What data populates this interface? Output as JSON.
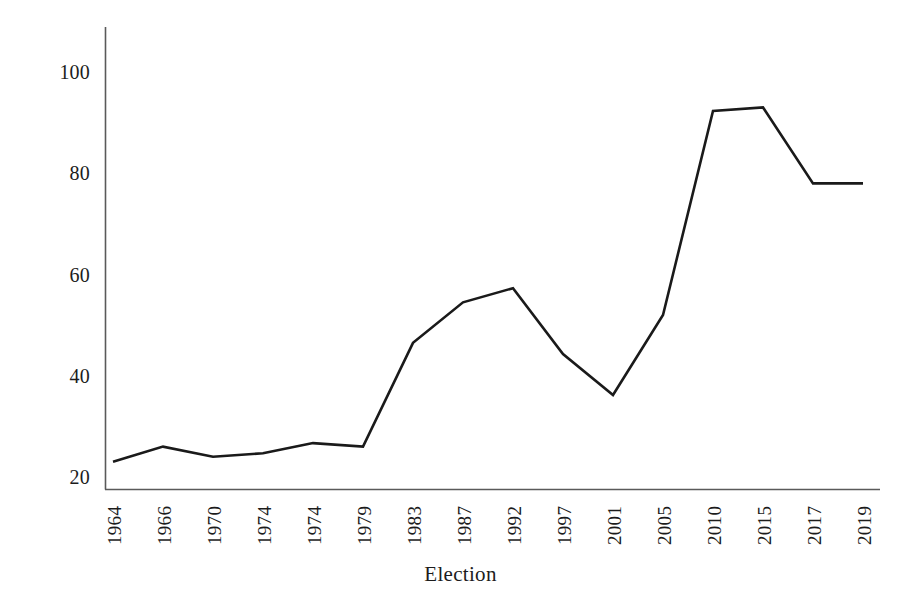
{
  "chart_data": {
    "type": "line",
    "title": "",
    "xlabel": "Election",
    "ylabel": "",
    "categories": [
      "1964",
      "1966",
      "1970",
      "1974",
      "1974",
      "1979",
      "1983",
      "1987",
      "1992",
      "1997",
      "2001",
      "2005",
      "2010",
      "2015",
      "2017",
      "2019"
    ],
    "values": [
      23.0,
      26.0,
      24.0,
      24.7,
      26.7,
      26.0,
      46.5,
      54.5,
      57.3,
      44.3,
      36.2,
      52.0,
      92.3,
      93.0,
      78.0,
      78.0
    ],
    "series": [
      {
        "name": "Election",
        "values": [
          23.0,
          26.0,
          24.0,
          24.7,
          26.7,
          26.0,
          46.5,
          54.5,
          57.3,
          44.3,
          36.2,
          52.0,
          92.3,
          93.0,
          78.0,
          78.0
        ]
      }
    ],
    "ylim": [
      15,
      106
    ],
    "yticks": [
      20,
      40,
      60,
      80,
      100
    ],
    "ytick_labels": [
      "20",
      "40",
      "60",
      "80",
      "100"
    ],
    "grid": false,
    "legend": false,
    "line_color": "#1a1a1a",
    "line_width": 2.6,
    "axis_color": "#5a5a5a",
    "background": "#ffffff"
  }
}
